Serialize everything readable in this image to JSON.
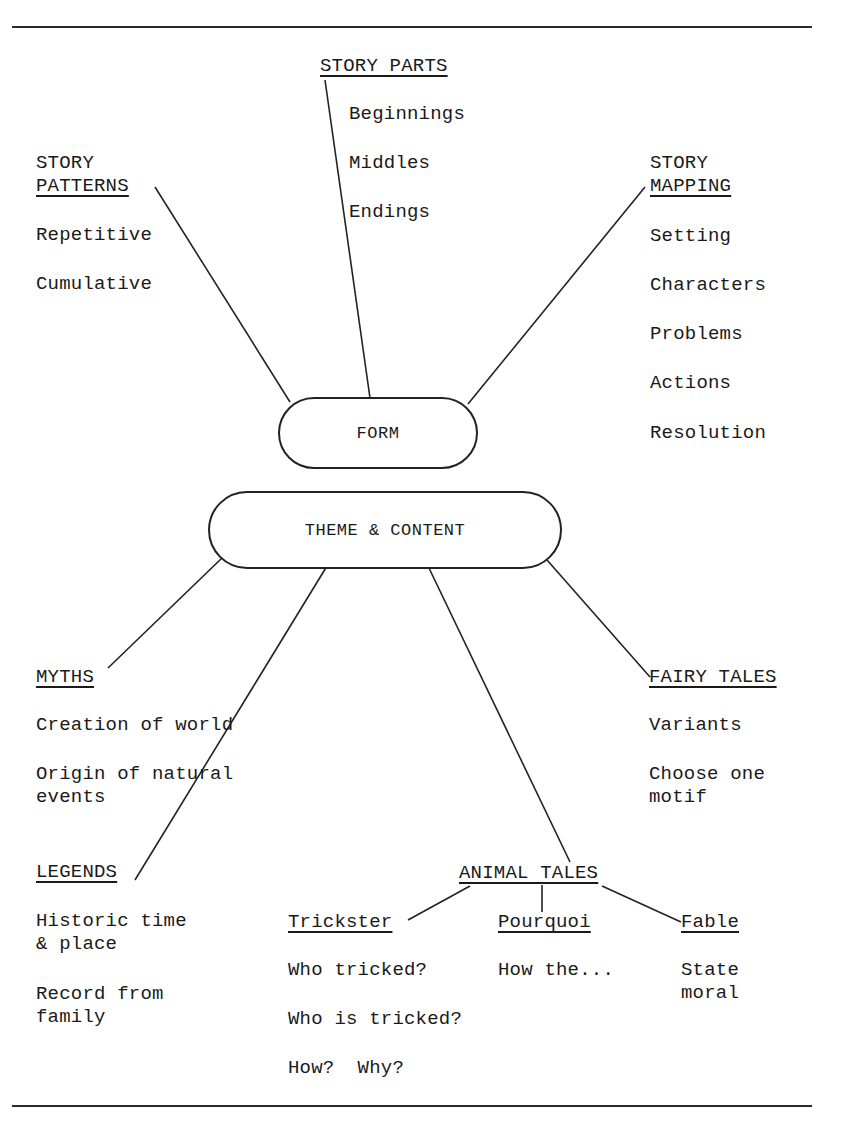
{
  "form": {
    "label": "FORM",
    "story_patterns": {
      "title_line1": "STORY",
      "title_line2": "PATTERNS",
      "items": [
        "Repetitive",
        "Cumulative"
      ]
    },
    "story_parts": {
      "title": "STORY PARTS",
      "items": [
        "Beginnings",
        "Middles",
        "Endings"
      ]
    },
    "story_mapping": {
      "title_line1": "STORY",
      "title_line2": "MAPPING",
      "items": [
        "Setting",
        "Characters",
        "Problems",
        "Actions",
        "Resolution"
      ]
    }
  },
  "theme": {
    "label": "THEME & CONTENT",
    "myths": {
      "title": "MYTHS",
      "items": [
        "Creation of world",
        "Origin of natural",
        "events"
      ]
    },
    "legends": {
      "title": "LEGENDS",
      "items": [
        "Historic time",
        "& place",
        "Record from",
        "family"
      ]
    },
    "fairy_tales": {
      "title": "FAIRY TALES",
      "items": [
        "Variants",
        "Choose one",
        "motif"
      ]
    },
    "animal_tales": {
      "title": "ANIMAL TALES",
      "trickster": {
        "title": "Trickster",
        "items": [
          "Who tricked?",
          "Who is tricked?",
          "How?  Why?"
        ]
      },
      "pourquoi": {
        "title": "Pourquoi",
        "items": [
          "How the..."
        ]
      },
      "fable": {
        "title": "Fable",
        "items": [
          "State",
          "moral"
        ]
      }
    }
  }
}
